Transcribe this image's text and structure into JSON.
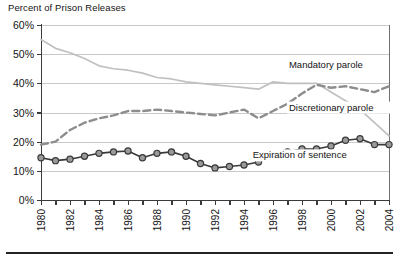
{
  "chart_data": {
    "type": "line",
    "title": "Percent of Prison Releases",
    "xlabel": "",
    "ylabel": "",
    "ylim": [
      0,
      60
    ],
    "xlim": [
      1980,
      2004
    ],
    "grid": true,
    "legend_position": "inline-right",
    "x": [
      1980,
      1981,
      1982,
      1983,
      1984,
      1985,
      1986,
      1987,
      1988,
      1989,
      1990,
      1991,
      1992,
      1993,
      1994,
      1995,
      1996,
      1997,
      1998,
      1999,
      2000,
      2001,
      2002,
      2003,
      2004
    ],
    "y_ticks": [
      0,
      10,
      20,
      30,
      40,
      50,
      60
    ],
    "y_tick_labels": [
      "0%",
      "10%",
      "20%",
      "30%",
      "40%",
      "50%",
      "60%"
    ],
    "x_tick_labels": [
      "1980",
      "1982",
      "1984",
      "1986",
      "1988",
      "1990",
      "1992",
      "1994",
      "1996",
      "1998",
      "2000",
      "2002",
      "2004"
    ],
    "series": [
      {
        "name": "Discretionary parole",
        "label": "Discretionary parole",
        "color": "#c0c0c0",
        "style": "solid",
        "markers": false,
        "values": [
          55.0,
          52.0,
          50.5,
          48.5,
          46.0,
          45.0,
          44.5,
          43.5,
          42.0,
          41.5,
          40.5,
          40.0,
          39.5,
          39.0,
          38.5,
          38.0,
          40.5,
          40.0,
          40.0,
          40.0,
          37.0,
          34.0,
          31.0,
          26.5,
          22.0
        ]
      },
      {
        "name": "Mandatory parole",
        "label": "Mandatory parole",
        "color": "#8d8d8d",
        "style": "dashed",
        "markers": false,
        "values": [
          19.0,
          20.0,
          24.0,
          26.5,
          28.0,
          29.0,
          30.5,
          30.5,
          31.0,
          30.5,
          30.0,
          29.5,
          29.0,
          30.0,
          31.0,
          28.0,
          30.5,
          33.0,
          36.5,
          39.5,
          38.5,
          39.0,
          38.0,
          37.0,
          39.0
        ]
      },
      {
        "name": "Expiration of sentence",
        "label": "Expiration of sentence",
        "color": "#3a3a3a",
        "style": "solid-marker",
        "markers": true,
        "values": [
          14.5,
          13.5,
          14.0,
          15.0,
          16.0,
          16.5,
          16.8,
          14.5,
          16.0,
          16.5,
          15.0,
          12.5,
          11.0,
          11.5,
          12.0,
          13.0,
          15.0,
          16.5,
          17.5,
          17.5,
          18.5,
          20.5,
          21.0,
          19.0,
          19.0
        ]
      }
    ],
    "annotations": [
      {
        "text": "Mandatory parole",
        "x": 1997.1,
        "y": 45.5
      },
      {
        "text": "Discretionary parole",
        "x": 1997.1,
        "y": 31.0
      },
      {
        "text": "Expiration of sentence",
        "x": 1994.6,
        "y": 14.6
      }
    ]
  },
  "header": {
    "title": "Percent of Prison Releases"
  }
}
